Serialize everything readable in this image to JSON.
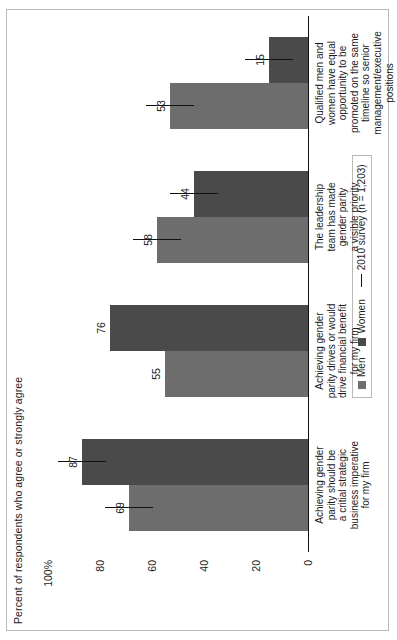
{
  "chart_data": {
    "type": "bar",
    "title": "",
    "ylabel": "Percent of respondents who agree or strongly agree",
    "xlabel": "",
    "ylim": [
      0,
      100
    ],
    "ytick_labels": [
      "100%",
      "80",
      "60",
      "40",
      "20",
      "0"
    ],
    "ytick_values": [
      100,
      80,
      60,
      40,
      20,
      0
    ],
    "grid": false,
    "orientation": "rotated-90-ccw",
    "legend_position": "bottom-right",
    "categories": [
      "Achieving gender parity should be a critial strategic business imperative for my firm",
      "Achieving gender parity drives or would drive financial benefit for my firm",
      "The leadership team has made gender parity a visible priority",
      "Qualified men and women have equal opportunity to be promoted on the same timeline so senior management/executive positions"
    ],
    "category_lines": [
      [
        "Achieving gender",
        "parity should be",
        "a critial strategic",
        "business imperative",
        "for my firm"
      ],
      [
        "Achieving gender",
        "parity drives or would",
        "drive financial benefit",
        "for my firm"
      ],
      [
        "The leadership",
        "team has made",
        "gender parity",
        "a visible priority"
      ],
      [
        "Qualified men and",
        "women have equal",
        "opportunity to be",
        "promoted on the same",
        "timeline so senior",
        "management/executive",
        "positions"
      ]
    ],
    "series": [
      {
        "name": "Men",
        "color": "#6d6d6d",
        "values": [
          69,
          55,
          58,
          53
        ]
      },
      {
        "name": "Women",
        "color": "#4a4a4a",
        "values": [
          87,
          76,
          44,
          15
        ]
      }
    ],
    "reference": {
      "name": "2010 survey (n = 1,203)",
      "marker": "line",
      "color": "#111111",
      "men": [
        69,
        null,
        58,
        53
      ],
      "women": [
        87,
        null,
        44,
        15
      ]
    },
    "legend": [
      {
        "label": "Men",
        "marker": "square",
        "color": "#6d6d6d"
      },
      {
        "label": "Women",
        "marker": "square",
        "color": "#4a4a4a"
      },
      {
        "label": "2010 survey (n = 1,203)",
        "marker": "line",
        "color": "#111111"
      }
    ]
  },
  "colors": {
    "men": "#6d6d6d",
    "women": "#4a4a4a",
    "axis": "#111111",
    "frame": "#b9b9b9",
    "background": "#ffffff"
  }
}
